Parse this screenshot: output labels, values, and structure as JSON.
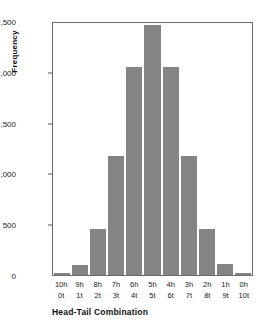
{
  "chart_data": {
    "type": "bar",
    "title": "",
    "xlabel": "Head-Tail Combination",
    "ylabel": "Frequency",
    "categories": [
      "10h\n0t",
      "9h\n1t",
      "8h\n2t",
      "7h\n3t",
      "6h\n4t",
      "5h\n5t",
      "4h\n6t",
      "3h\n7t",
      "2h\n8t",
      "1h\n9t",
      "0h\n10t"
    ],
    "category_top": [
      "10h",
      "9h",
      "8h",
      "7h",
      "6h",
      "5h",
      "4h",
      "3h",
      "2h",
      "1h",
      "0h"
    ],
    "category_bottom": [
      "0t",
      "1t",
      "2t",
      "3t",
      "4t",
      "5t",
      "6t",
      "7t",
      "8t",
      "9t",
      "10t"
    ],
    "values": [
      15,
      100,
      450,
      1170,
      2050,
      2460,
      2050,
      1170,
      455,
      105,
      20
    ],
    "ylim": [
      0,
      2500
    ],
    "yticks": [
      0,
      500,
      1000,
      1500,
      2000,
      2500
    ],
    "ytick_labels": [
      "0",
      "500",
      "1,000",
      "1,500",
      "2,000",
      "2,500"
    ],
    "grid": false,
    "legend": null,
    "bar_color": "#848484",
    "axis_color": "#6b6b6b"
  }
}
